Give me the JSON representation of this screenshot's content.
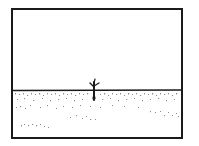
{
  "scene": {
    "description": "Line drawing of a flat empty landscape with a small bare tree on the horizon, enclosed in a rectangular frame",
    "elements": [
      "frame",
      "horizon-line",
      "bare-tree",
      "ground-stipple"
    ],
    "colors": {
      "ink": "#1a1a1a",
      "background": "#ffffff",
      "stipple": "#8a8a8a"
    }
  }
}
